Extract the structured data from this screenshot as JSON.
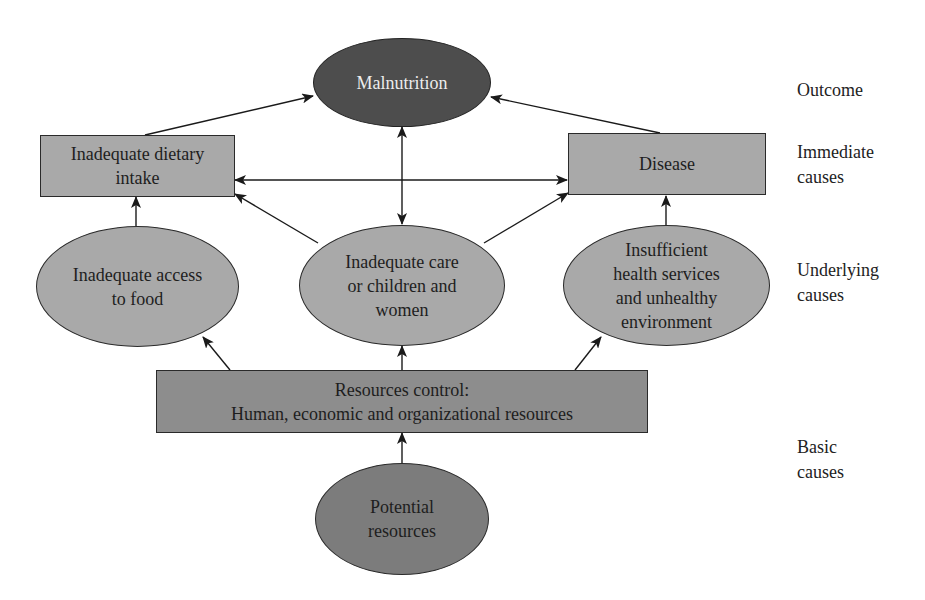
{
  "diagram": {
    "colors": {
      "outcome_fill": "#4d4d4d",
      "immediate_fill": "#a9a9a9",
      "underlying_fill": "#a9a9a9",
      "resources_fill": "#8d8d8d",
      "potential_fill": "#7c7c7c",
      "edge": "#1a1a1a",
      "outcome_text": "#ececec",
      "text": "#1e1e1e"
    },
    "nodes": {
      "malnutrition": {
        "shape": "ellipse",
        "lines": [
          "Malnutrition"
        ]
      },
      "dietary_intake": {
        "shape": "rectangle",
        "lines": [
          "Inadequate dietary",
          "intake"
        ]
      },
      "disease": {
        "shape": "rectangle",
        "lines": [
          "Disease"
        ]
      },
      "access_food": {
        "shape": "ellipse",
        "lines": [
          "Inadequate access",
          "to food"
        ]
      },
      "care": {
        "shape": "ellipse",
        "lines": [
          "Inadequate care",
          "or children and",
          "women"
        ]
      },
      "health_services": {
        "shape": "ellipse",
        "lines": [
          "Insufficient",
          "health services",
          "and unhealthy",
          "environment"
        ]
      },
      "resources_control": {
        "shape": "rectangle",
        "lines": [
          "Resources control:",
          "Human, economic and organizational resources"
        ]
      },
      "potential_resources": {
        "shape": "ellipse",
        "lines": [
          "Potential",
          "resources"
        ]
      }
    },
    "levels": [
      {
        "lines": [
          "Outcome"
        ]
      },
      {
        "lines": [
          "Immediate",
          "causes"
        ]
      },
      {
        "lines": [
          "Underlying",
          "causes"
        ]
      },
      {
        "lines": [
          "Basic",
          "causes"
        ]
      }
    ],
    "edges": [
      {
        "from": "dietary_intake",
        "to": "malnutrition",
        "type": "arrow"
      },
      {
        "from": "disease",
        "to": "malnutrition",
        "type": "arrow"
      },
      {
        "from": "malnutrition",
        "to": "care",
        "type": "double-arrow"
      },
      {
        "from": "dietary_intake",
        "to": "disease",
        "type": "double-arrow"
      },
      {
        "from": "access_food",
        "to": "dietary_intake",
        "type": "arrow"
      },
      {
        "from": "care",
        "to": "dietary_intake",
        "type": "arrow"
      },
      {
        "from": "care",
        "to": "disease",
        "type": "arrow"
      },
      {
        "from": "health_services",
        "to": "disease",
        "type": "arrow"
      },
      {
        "from": "resources_control",
        "to": "access_food",
        "type": "arrow"
      },
      {
        "from": "resources_control",
        "to": "care",
        "type": "arrow"
      },
      {
        "from": "resources_control",
        "to": "health_services",
        "type": "arrow"
      },
      {
        "from": "potential_resources",
        "to": "resources_control",
        "type": "arrow"
      }
    ]
  }
}
